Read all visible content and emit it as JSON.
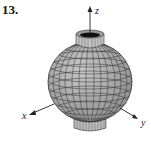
{
  "figure": {
    "number": "13.",
    "axes": {
      "x": "x",
      "y": "y",
      "z": "z"
    },
    "surface": "sphere-like surface with cylindrical neck at top and bottom",
    "colors": {
      "surface": "#a8a8a8",
      "mesh": "#333333",
      "axis": "#222222",
      "background": "#ffffff"
    }
  }
}
